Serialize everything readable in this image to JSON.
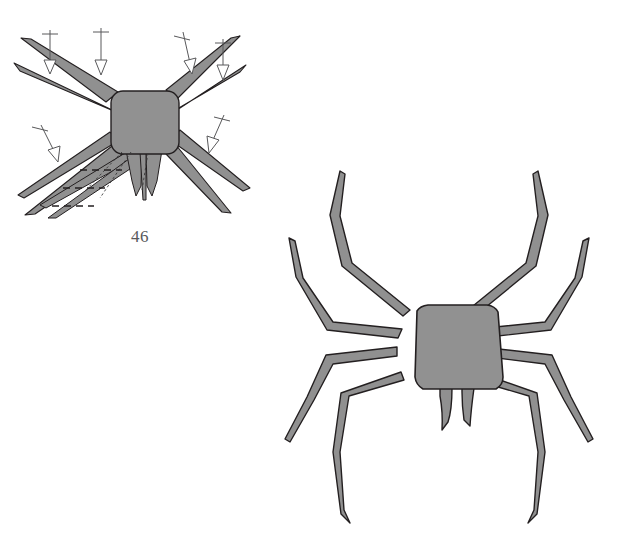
{
  "plate": {
    "width": 635,
    "height": 547,
    "background_color": "#ffffff",
    "caption_color": "#58585a",
    "body_fill": "#909090",
    "leg_fill": "#909090",
    "outline_color": "#231f20",
    "annotation_color": "#58585a",
    "annotation_fill": "#ffffff"
  },
  "figures": [
    {
      "id": "figure-46",
      "number_label": "46",
      "description": "spider schematic with annotation arrows and dashed setae marks",
      "leg_count": 8,
      "fang_count": 2,
      "annotations": {
        "arrow_count": 6,
        "dash_mark_count": 3,
        "arrow_style": "hollow-triangle-with-crossbar",
        "dash_style": "short-dashed-segment"
      }
    },
    {
      "id": "figure-habitus",
      "number_label": "",
      "description": "large spider habitus drawing, dorsal view",
      "leg_count": 8,
      "fang_count": 2,
      "annotations": {
        "arrow_count": 0,
        "dash_mark_count": 0,
        "arrow_style": "",
        "dash_style": ""
      }
    }
  ]
}
